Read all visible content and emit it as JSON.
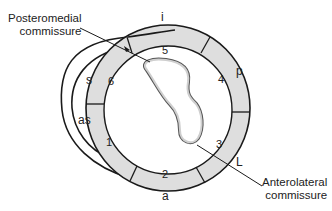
{
  "diagram": {
    "colors": {
      "wall_fill": "#dedede",
      "stroke": "#1a1a1a",
      "background": "#ffffff",
      "valve_fill": "#cfcfcf"
    },
    "callouts": {
      "posteromedial_line1": "Posteromedial",
      "posteromedial_line2": "commissure",
      "anterolateral_line1": "Anterolateral",
      "anterolateral_line2": "commissure"
    },
    "segments": [
      {
        "number": "1"
      },
      {
        "number": "2"
      },
      {
        "number": "3"
      },
      {
        "number": "4"
      },
      {
        "number": "5"
      },
      {
        "number": "6"
      }
    ],
    "wall_labels": {
      "inferior": "i",
      "posterior": "p",
      "lateral": "L",
      "anterior": "a",
      "septal": "s",
      "anteroseptal": "as"
    }
  }
}
